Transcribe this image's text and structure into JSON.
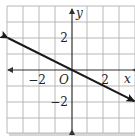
{
  "chart_data": {
    "type": "line",
    "title": "",
    "xlabel": "x",
    "ylabel": "y",
    "origin_label": "O",
    "xlim": [
      -4.1,
      4
    ],
    "ylim": [
      -4,
      4
    ],
    "grid": true,
    "grid_step": 1,
    "x_ticks": [
      {
        "value": -2,
        "label": "−2"
      },
      {
        "value": 2,
        "label": "2"
      }
    ],
    "y_ticks": [
      {
        "value": 2,
        "label": "2"
      },
      {
        "value": -2,
        "label": "−2"
      }
    ],
    "series": [
      {
        "name": "y = -x/2",
        "x": [
          -4.0,
          -2,
          0,
          2,
          3.9
        ],
        "y": [
          2.0,
          1,
          0,
          -1,
          -1.95
        ],
        "arrows": "both",
        "color": "#1a1a1a"
      }
    ],
    "legend": null
  },
  "colors": {
    "grid": "#b8b8b8",
    "axis": "#333333",
    "line": "#1a1a1a",
    "shadow": "#cfcfcf"
  }
}
